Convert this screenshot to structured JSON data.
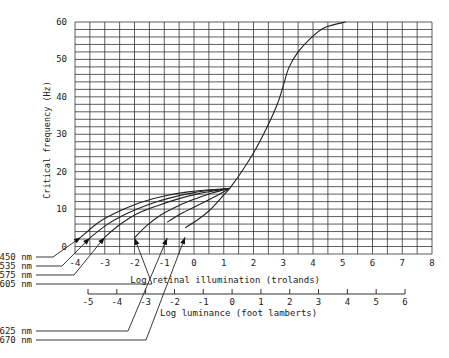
{
  "chart_data": {
    "type": "line",
    "title": "",
    "ylabel": "Critical frequency (Hz)",
    "xlabel": "Log retinal illumination (trolands)",
    "x2label": "Log luminance (foot lamberts)",
    "xlim": [
      -4,
      8
    ],
    "ylim": [
      -2,
      60
    ],
    "x2lim": [
      -5,
      6
    ],
    "grid": true,
    "x_ticks": [
      -4,
      -3,
      -2,
      -1,
      0,
      1,
      2,
      3,
      4,
      5,
      6,
      7,
      8
    ],
    "x_tick_labels": [
      "-4",
      "-3",
      "-2",
      "-1",
      "0",
      "1",
      "2",
      "3",
      "4",
      "5",
      "6",
      "7",
      "8"
    ],
    "y_ticks": [
      0,
      10,
      20,
      30,
      40,
      50,
      60
    ],
    "y_tick_labels": [
      "0",
      "10",
      "20",
      "30",
      "40",
      "50",
      "60"
    ],
    "x2_ticks": [
      -5,
      -4,
      -3,
      -2,
      -1,
      0,
      1,
      2,
      3,
      4,
      5,
      6
    ],
    "x2_tick_labels": [
      "-5",
      "-4",
      "-3",
      "-2",
      "-1",
      "0",
      "1",
      "2",
      "3",
      "4",
      "5",
      "6"
    ],
    "common_curve": {
      "name": "photopic (shared)",
      "x": [
        1.2,
        1.6,
        2.0,
        2.4,
        2.8,
        3.0,
        3.2,
        3.5,
        3.9,
        4.4,
        5.1
      ],
      "y": [
        15.5,
        20,
        25,
        31,
        38,
        43,
        48,
        52,
        55.5,
        58.5,
        60
      ]
    },
    "series": [
      {
        "name": "450 nm",
        "x": [
          -3.8,
          -3.2,
          -2.5,
          -1.8,
          -1.0,
          -0.2,
          0.6,
          1.2
        ],
        "y": [
          2.5,
          6.5,
          9.5,
          11.8,
          13.5,
          14.6,
          15.2,
          15.5
        ]
      },
      {
        "name": "535 nm",
        "x": [
          -3.5,
          -2.9,
          -2.2,
          -1.5,
          -0.8,
          0.0,
          0.7,
          1.2
        ],
        "y": [
          2.3,
          6.0,
          9.0,
          11.3,
          13.0,
          14.4,
          15.1,
          15.5
        ]
      },
      {
        "name": "575 nm",
        "x": [
          -3.0,
          -2.5,
          -1.9,
          -1.2,
          -0.5,
          0.2,
          0.8,
          1.2
        ],
        "y": [
          2.5,
          5.8,
          8.8,
          11.0,
          12.8,
          14.2,
          15.0,
          15.5
        ]
      },
      {
        "name": "605 nm",
        "x": [
          -2.0,
          -1.6,
          -1.1,
          -0.5,
          0.1,
          0.6,
          1.0,
          1.2
        ],
        "y": [
          2.3,
          5.5,
          8.5,
          11.0,
          12.9,
          14.3,
          15.1,
          15.5
        ]
      },
      {
        "name": "625 nm",
        "x": [
          -0.9,
          -0.5,
          0.0,
          0.5,
          0.9,
          1.2
        ],
        "y": [
          6.5,
          8.5,
          10.5,
          12.5,
          14.2,
          15.5
        ]
      },
      {
        "name": "670 nm",
        "x": [
          -0.3,
          0.1,
          0.5,
          0.8,
          1.0,
          1.2
        ],
        "y": [
          5.0,
          7.0,
          9.5,
          12.0,
          13.8,
          15.5
        ]
      }
    ],
    "arrow_tips": [
      {
        "name": "450 nm",
        "x": -3.8,
        "y": 2.5
      },
      {
        "name": "535 nm",
        "x": -3.5,
        "y": 2.3
      },
      {
        "name": "575 nm",
        "x": -3.0,
        "y": 2.5
      },
      {
        "name": "605 nm",
        "x": -2.0,
        "y": 2.3
      },
      {
        "name": "625 nm",
        "x": -0.9,
        "y": 2.3
      },
      {
        "name": "670 nm",
        "x": -0.3,
        "y": 2.5
      }
    ],
    "legend_labels": [
      "450 nm",
      "535 nm",
      "575 nm",
      "605 nm",
      "625 nm",
      "670 nm"
    ]
  }
}
